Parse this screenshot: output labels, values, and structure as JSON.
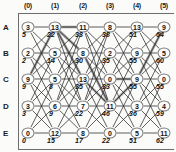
{
  "figure": {
    "type": "trellis-lattice-diagram",
    "columns": [
      "(0)",
      "(1)",
      "(2)",
      "(3)",
      "(4)",
      "(5)"
    ],
    "rows": [
      "A",
      "B",
      "C",
      "D",
      "E"
    ],
    "node_radius_px": 6.5,
    "colors": {
      "background": "#fbfbfa",
      "edge": "#2a2a2a",
      "highlight_edge": "#9a9a9a",
      "node_border": "#7a7a7a",
      "node_fill": "#fdfdfd",
      "text": "#111111",
      "frame": "#6d6d6d"
    },
    "nodes": [
      {
        "row": "A",
        "col": 0,
        "label": "3",
        "value": "5"
      },
      {
        "row": "A",
        "col": 1,
        "label": "13",
        "value": "22"
      },
      {
        "row": "A",
        "col": 2,
        "label": "11",
        "value": "33"
      },
      {
        "row": "A",
        "col": 3,
        "label": "8",
        "value": "38"
      },
      {
        "row": "A",
        "col": 4,
        "label": "13",
        "value": "51"
      },
      {
        "row": "A",
        "col": 5,
        "label": "9",
        "value": "64"
      },
      {
        "row": "B",
        "col": 0,
        "label": "2",
        "value": "2"
      },
      {
        "row": "B",
        "col": 1,
        "label": "5",
        "value": "14"
      },
      {
        "row": "B",
        "col": 2,
        "label": "8",
        "value": "30"
      },
      {
        "row": "B",
        "col": 3,
        "label": "2",
        "value": "35"
      },
      {
        "row": "B",
        "col": 4,
        "label": "9",
        "value": "55"
      },
      {
        "row": "B",
        "col": 5,
        "label": "5",
        "value": "60"
      },
      {
        "row": "C",
        "col": 0,
        "label": "9",
        "value": "9"
      },
      {
        "row": "C",
        "col": 1,
        "label": "5",
        "value": "8"
      },
      {
        "row": "C",
        "col": 2,
        "label": "13",
        "value": "35"
      },
      {
        "row": "C",
        "col": 3,
        "label": "0",
        "value": "33"
      },
      {
        "row": "C",
        "col": 4,
        "label": "9",
        "value": "55"
      },
      {
        "row": "C",
        "col": 5,
        "label": "0",
        "value": "55"
      },
      {
        "row": "D",
        "col": 0,
        "label": "3",
        "value": "3"
      },
      {
        "row": "D",
        "col": 1,
        "label": "6",
        "value": "9"
      },
      {
        "row": "D",
        "col": 2,
        "label": "7",
        "value": "22"
      },
      {
        "row": "D",
        "col": 3,
        "label": "11",
        "value": "46"
      },
      {
        "row": "D",
        "col": 4,
        "label": "3",
        "value": "36"
      },
      {
        "row": "D",
        "col": 5,
        "label": "4",
        "value": "59"
      },
      {
        "row": "E",
        "col": 0,
        "label": "0",
        "value": "0"
      },
      {
        "row": "E",
        "col": 1,
        "label": "12",
        "value": "15"
      },
      {
        "row": "E",
        "col": 2,
        "label": "8",
        "value": "17"
      },
      {
        "row": "E",
        "col": 3,
        "label": "0",
        "value": "22"
      },
      {
        "row": "E",
        "col": 4,
        "label": "5",
        "value": "51"
      },
      {
        "row": "E",
        "col": 5,
        "label": "11",
        "value": "62"
      }
    ],
    "edges": [
      [
        "A0",
        "A1"
      ],
      [
        "A1",
        "A2"
      ],
      [
        "A2",
        "A3"
      ],
      [
        "A3",
        "A4"
      ],
      [
        "A4",
        "A5"
      ],
      [
        "B0",
        "B1"
      ],
      [
        "B1",
        "B2"
      ],
      [
        "B2",
        "B3"
      ],
      [
        "B3",
        "B4"
      ],
      [
        "B4",
        "B5"
      ],
      [
        "C0",
        "C1"
      ],
      [
        "C1",
        "C2"
      ],
      [
        "C2",
        "C3"
      ],
      [
        "C3",
        "C4"
      ],
      [
        "C4",
        "C5"
      ],
      [
        "D0",
        "D1"
      ],
      [
        "D1",
        "D2"
      ],
      [
        "D2",
        "D3"
      ],
      [
        "D3",
        "D4"
      ],
      [
        "D4",
        "D5"
      ],
      [
        "E0",
        "E1"
      ],
      [
        "E1",
        "E2"
      ],
      [
        "E2",
        "E3"
      ],
      [
        "E3",
        "E4"
      ],
      [
        "E4",
        "E5"
      ],
      [
        "A0",
        "B1"
      ],
      [
        "B0",
        "A1"
      ],
      [
        "A0",
        "C1"
      ],
      [
        "C0",
        "A1"
      ],
      [
        "B0",
        "C1"
      ],
      [
        "C0",
        "B1"
      ],
      [
        "B0",
        "D1"
      ],
      [
        "D0",
        "B1"
      ],
      [
        "C0",
        "D1"
      ],
      [
        "D0",
        "C1"
      ],
      [
        "C0",
        "E1"
      ],
      [
        "E0",
        "C1"
      ],
      [
        "D0",
        "E1"
      ],
      [
        "E0",
        "D1"
      ],
      [
        "A1",
        "B2"
      ],
      [
        "B1",
        "A2"
      ],
      [
        "A1",
        "C2"
      ],
      [
        "C1",
        "A2"
      ],
      [
        "A1",
        "D2"
      ],
      [
        "D1",
        "A2"
      ],
      [
        "B1",
        "C2"
      ],
      [
        "C1",
        "B2"
      ],
      [
        "B1",
        "D2"
      ],
      [
        "D1",
        "B2"
      ],
      [
        "C1",
        "D2"
      ],
      [
        "D1",
        "C2"
      ],
      [
        "C1",
        "E2"
      ],
      [
        "E1",
        "C2"
      ],
      [
        "D1",
        "E2"
      ],
      [
        "E1",
        "D2"
      ],
      [
        "A2",
        "B3"
      ],
      [
        "B2",
        "A3"
      ],
      [
        "A2",
        "C3"
      ],
      [
        "C2",
        "A3"
      ],
      [
        "A2",
        "D3"
      ],
      [
        "D2",
        "A3"
      ],
      [
        "B2",
        "C3"
      ],
      [
        "C2",
        "B3"
      ],
      [
        "B2",
        "D3"
      ],
      [
        "D2",
        "B3"
      ],
      [
        "C2",
        "D3"
      ],
      [
        "D2",
        "C3"
      ],
      [
        "C2",
        "E3"
      ],
      [
        "E2",
        "C3"
      ],
      [
        "D2",
        "E3"
      ],
      [
        "E2",
        "D3"
      ],
      [
        "A3",
        "B4"
      ],
      [
        "B3",
        "A4"
      ],
      [
        "A3",
        "C4"
      ],
      [
        "C3",
        "A4"
      ],
      [
        "B3",
        "C4"
      ],
      [
        "C3",
        "B4"
      ],
      [
        "B3",
        "D4"
      ],
      [
        "D3",
        "B4"
      ],
      [
        "C3",
        "D4"
      ],
      [
        "D3",
        "C4"
      ],
      [
        "C3",
        "E4"
      ],
      [
        "E3",
        "C4"
      ],
      [
        "D3",
        "E4"
      ],
      [
        "E3",
        "D4"
      ],
      [
        "A4",
        "B5"
      ],
      [
        "B4",
        "A5"
      ],
      [
        "A4",
        "C5"
      ],
      [
        "C4",
        "A5"
      ],
      [
        "B4",
        "C5"
      ],
      [
        "C4",
        "B5"
      ],
      [
        "B4",
        "D5"
      ],
      [
        "D4",
        "B5"
      ],
      [
        "C4",
        "D5"
      ],
      [
        "D4",
        "C5"
      ],
      [
        "C4",
        "E5"
      ],
      [
        "E4",
        "C5"
      ],
      [
        "D4",
        "E5"
      ],
      [
        "E4",
        "D5"
      ]
    ],
    "highlight_edges": [
      [
        "C0",
        "A1"
      ],
      [
        "A1",
        "C2"
      ],
      [
        "C2",
        "D3"
      ],
      [
        "A1",
        "B2"
      ],
      [
        "B2",
        "D3"
      ],
      [
        "D3",
        "C4"
      ],
      [
        "C4",
        "A5"
      ],
      [
        "C3",
        "C4"
      ],
      [
        "A1",
        "A2"
      ]
    ]
  }
}
